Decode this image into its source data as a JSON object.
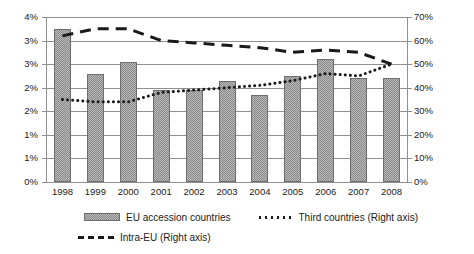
{
  "chart_data": {
    "type": "bar",
    "title": "",
    "xlabel": "",
    "ylabel": "",
    "categories": [
      "1998",
      "1999",
      "2000",
      "2001",
      "2002",
      "2003",
      "2004",
      "2005",
      "2006",
      "2007",
      "2008"
    ],
    "left_axis": {
      "label": "",
      "ylim": [
        0,
        3.5
      ],
      "tick_values": [
        0,
        0.5,
        1.0,
        1.5,
        2.0,
        2.5,
        3.0,
        3.5
      ],
      "tick_labels": [
        "0%",
        "1%",
        "1%",
        "2%",
        "2%",
        "3%",
        "3%",
        "4%"
      ]
    },
    "right_axis": {
      "label": "",
      "ylim": [
        0,
        70
      ],
      "tick_values": [
        0,
        10,
        20,
        30,
        40,
        50,
        60,
        70
      ],
      "tick_labels": [
        "0%",
        "10%",
        "20%",
        "30%",
        "40%",
        "50%",
        "60%",
        "70%"
      ]
    },
    "grid": true,
    "legend_position": "bottom",
    "series": [
      {
        "name": "EU accession countries",
        "type": "bar",
        "axis": "left",
        "values": [
          3.25,
          2.3,
          2.55,
          1.95,
          1.95,
          2.15,
          1.85,
          2.25,
          2.6,
          2.2,
          2.2
        ]
      },
      {
        "name": "Third countries (Right axis)",
        "type": "line",
        "style": "dotted",
        "axis": "right",
        "values": [
          35,
          34,
          34,
          38,
          39,
          40,
          41,
          43,
          46,
          45,
          50
        ]
      },
      {
        "name": "Intra-EU (Right axis)",
        "type": "line",
        "style": "dashed",
        "axis": "right",
        "values": [
          62,
          65,
          65,
          60,
          59,
          58,
          57,
          55,
          56,
          55,
          50
        ]
      }
    ]
  },
  "legend": {
    "items": [
      {
        "label": "EU accession countries",
        "marker": "bar-swatch-icon"
      },
      {
        "label": "Third countries (Right axis)",
        "marker": "dotted-line-icon"
      },
      {
        "label": "Intra-EU (Right axis)",
        "marker": "dashed-line-icon"
      }
    ]
  }
}
